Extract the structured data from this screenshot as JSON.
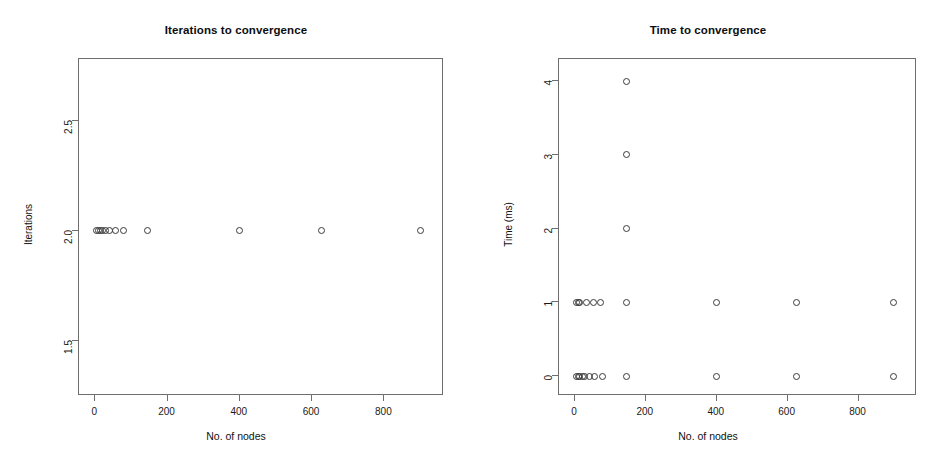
{
  "figure": {
    "background": "#ffffff",
    "point_color": "#3a3a3a",
    "axis_color": "#6e6e6e"
  },
  "chart_data": [
    {
      "type": "scatter",
      "title": "Iterations to convergence",
      "xlabel": "No. of nodes",
      "ylabel": "Iterations",
      "xlim": [
        -45,
        965
      ],
      "ylim": [
        1.25,
        2.78
      ],
      "xticks": [
        0,
        200,
        400,
        600,
        800
      ],
      "yticks": [
        1.5,
        2.0,
        2.5
      ],
      "xticklabels": [
        "0",
        "200",
        "400",
        "600",
        "800"
      ],
      "yticklabels": [
        "1.5",
        "2.0",
        "2.5"
      ],
      "grid": false,
      "legend": false,
      "marker": "open-circle",
      "points": [
        {
          "x": 4,
          "y": 2.0
        },
        {
          "x": 9,
          "y": 2.0
        },
        {
          "x": 14,
          "y": 2.0
        },
        {
          "x": 20,
          "y": 2.0
        },
        {
          "x": 28,
          "y": 2.0
        },
        {
          "x": 40,
          "y": 2.0
        },
        {
          "x": 56,
          "y": 2.0
        },
        {
          "x": 78,
          "y": 2.0
        },
        {
          "x": 145,
          "y": 2.0
        },
        {
          "x": 400,
          "y": 2.0
        },
        {
          "x": 625,
          "y": 2.0
        },
        {
          "x": 900,
          "y": 2.0
        }
      ]
    },
    {
      "type": "scatter",
      "title": "Time to convergence",
      "xlabel": "No. of nodes",
      "ylabel": "Time (ms)",
      "xlim": [
        -45,
        965
      ],
      "ylim": [
        -0.27,
        4.3
      ],
      "xticks": [
        0,
        200,
        400,
        600,
        800
      ],
      "yticks": [
        0,
        1,
        2,
        3,
        4
      ],
      "xticklabels": [
        "0",
        "200",
        "400",
        "600",
        "800"
      ],
      "yticklabels": [
        "0",
        "1",
        "2",
        "3",
        "4"
      ],
      "grid": false,
      "legend": false,
      "marker": "open-circle",
      "points": [
        {
          "x": 4,
          "y": 0
        },
        {
          "x": 9,
          "y": 0
        },
        {
          "x": 14,
          "y": 0
        },
        {
          "x": 20,
          "y": 0
        },
        {
          "x": 28,
          "y": 0
        },
        {
          "x": 40,
          "y": 0
        },
        {
          "x": 56,
          "y": 0
        },
        {
          "x": 78,
          "y": 0
        },
        {
          "x": 145,
          "y": 0
        },
        {
          "x": 400,
          "y": 0
        },
        {
          "x": 625,
          "y": 0
        },
        {
          "x": 900,
          "y": 0
        },
        {
          "x": 4,
          "y": 1
        },
        {
          "x": 9,
          "y": 1
        },
        {
          "x": 14,
          "y": 1
        },
        {
          "x": 32,
          "y": 1
        },
        {
          "x": 52,
          "y": 1
        },
        {
          "x": 72,
          "y": 1
        },
        {
          "x": 145,
          "y": 1
        },
        {
          "x": 400,
          "y": 1
        },
        {
          "x": 625,
          "y": 1
        },
        {
          "x": 900,
          "y": 1
        },
        {
          "x": 145,
          "y": 2
        },
        {
          "x": 145,
          "y": 3
        },
        {
          "x": 145,
          "y": 4
        }
      ]
    }
  ]
}
